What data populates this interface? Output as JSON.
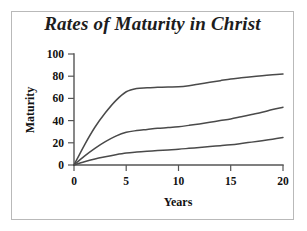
{
  "chart_data": {
    "type": "line",
    "title": "Rates of Maturity in Christ",
    "xlabel": "Years",
    "ylabel": "Maturity",
    "xlim": [
      0,
      20
    ],
    "ylim": [
      0,
      100
    ],
    "xticks": [
      0,
      5,
      10,
      15,
      20
    ],
    "yticks": [
      0,
      20,
      40,
      60,
      80,
      100
    ],
    "xtick_labels": [
      "0",
      "5",
      "10",
      "15",
      "20"
    ],
    "ytick_labels": [
      "0",
      "20",
      "40",
      "60",
      "80",
      "100"
    ],
    "grid": false,
    "legend": false,
    "line_color": "#4a4a4a",
    "background_color": "#ffffff",
    "border_color": "#b9b9b9",
    "x": [
      0,
      1,
      2,
      3,
      4,
      5,
      6,
      7,
      8,
      9,
      10,
      11,
      12,
      13,
      14,
      15,
      16,
      17,
      18,
      19,
      20
    ],
    "series": [
      {
        "name": "fast-maturity",
        "values": [
          0,
          18,
          34,
          47,
          58,
          66,
          69,
          69.5,
          70,
          70.3,
          70.5,
          71.5,
          73,
          74.5,
          76,
          77.5,
          78.5,
          79.5,
          80.5,
          81.3,
          82
        ]
      },
      {
        "name": "moderate-maturity",
        "values": [
          0,
          8,
          15,
          21,
          26,
          29.5,
          31,
          32,
          33,
          33.7,
          34.5,
          35.7,
          37,
          38.5,
          40,
          41.5,
          43.5,
          45.5,
          47.5,
          50,
          52
        ]
      },
      {
        "name": "slow-maturity",
        "values": [
          0,
          3,
          5.5,
          7.5,
          9.3,
          10.8,
          11.7,
          12.4,
          13,
          13.6,
          14.2,
          15,
          15.8,
          16.6,
          17.4,
          18.3,
          19.4,
          20.6,
          21.9,
          23.3,
          24.8
        ]
      }
    ]
  }
}
